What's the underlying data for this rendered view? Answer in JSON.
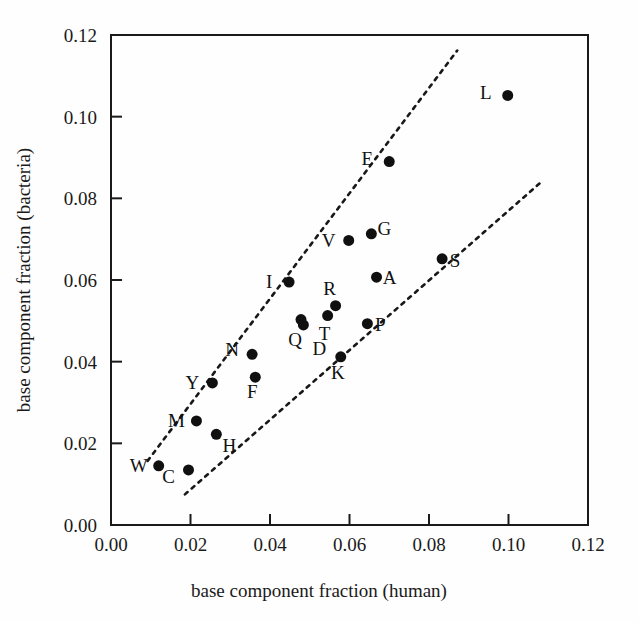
{
  "chart_data": {
    "type": "scatter",
    "title": "",
    "xlabel": "base component fraction (human)",
    "ylabel": "base component fraction (bacteria)",
    "xlim": [
      0.0,
      0.12
    ],
    "ylim": [
      0.0,
      0.12
    ],
    "xticks": [
      "0.00",
      "0.02",
      "0.04",
      "0.06",
      "0.08",
      "0.10",
      "0.12"
    ],
    "yticks": [
      "0.00",
      "0.02",
      "0.04",
      "0.06",
      "0.08",
      "0.10",
      "0.12"
    ],
    "xtick_values": [
      0.0,
      0.02,
      0.04,
      0.06,
      0.08,
      0.1,
      0.12
    ],
    "ytick_values": [
      0.0,
      0.02,
      0.04,
      0.06,
      0.08,
      0.1,
      0.12
    ],
    "grid": false,
    "legend": "none",
    "points": [
      {
        "label": "W",
        "x": 0.012,
        "y": 0.0145,
        "label_dx": -20,
        "label_dy": 6
      },
      {
        "label": "C",
        "x": 0.0195,
        "y": 0.0135,
        "label_dx": -20,
        "label_dy": 13
      },
      {
        "label": "M",
        "x": 0.0215,
        "y": 0.0255,
        "label_dx": -20,
        "label_dy": 6
      },
      {
        "label": "H",
        "x": 0.0265,
        "y": 0.0222,
        "label_dx": 13,
        "label_dy": 18
      },
      {
        "label": "Y",
        "x": 0.0255,
        "y": 0.0348,
        "label_dx": -20,
        "label_dy": 6
      },
      {
        "label": "F",
        "x": 0.0363,
        "y": 0.0362,
        "label_dx": -3,
        "label_dy": 21
      },
      {
        "label": "N",
        "x": 0.0355,
        "y": 0.0418,
        "label_dx": -20,
        "label_dy": 2
      },
      {
        "label": "I",
        "x": 0.0448,
        "y": 0.0595,
        "label_dx": -20,
        "label_dy": 6
      },
      {
        "label": "Q",
        "x": 0.0478,
        "y": 0.0503,
        "label_dx": -6,
        "label_dy": 26
      },
      {
        "label": "D",
        "x": 0.0484,
        "y": 0.049,
        "label_dx": 16,
        "label_dy": 30
      },
      {
        "label": "K",
        "x": 0.0578,
        "y": 0.0412,
        "label_dx": -3,
        "label_dy": 22
      },
      {
        "label": "T",
        "x": 0.0545,
        "y": 0.0513,
        "label_dx": -3,
        "label_dy": 24
      },
      {
        "label": "R",
        "x": 0.0565,
        "y": 0.0537,
        "label_dx": -6,
        "label_dy": -11
      },
      {
        "label": "P",
        "x": 0.0645,
        "y": 0.0493,
        "label_dx": 13,
        "label_dy": 7
      },
      {
        "label": "V",
        "x": 0.0598,
        "y": 0.0697,
        "label_dx": -20,
        "label_dy": 7
      },
      {
        "label": "G",
        "x": 0.0655,
        "y": 0.0713,
        "label_dx": 13,
        "label_dy": 1
      },
      {
        "label": "A",
        "x": 0.0668,
        "y": 0.0607,
        "label_dx": 13,
        "label_dy": 7
      },
      {
        "label": "E",
        "x": 0.07,
        "y": 0.089,
        "label_dx": -22,
        "label_dy": 3
      },
      {
        "label": "S",
        "x": 0.0833,
        "y": 0.0652,
        "label_dx": 13,
        "label_dy": 8
      },
      {
        "label": "L",
        "x": 0.0998,
        "y": 0.1052,
        "label_dx": -22,
        "label_dy": 4
      }
    ],
    "reference_lines": [
      {
        "name": "upper-bound-line",
        "x1": 0.0092,
        "y1": 0.0157,
        "x2": 0.0871,
        "y2": 0.1162,
        "style": "dashed"
      },
      {
        "name": "lower-bound-line",
        "x1": 0.0186,
        "y1": 0.0075,
        "x2": 0.108,
        "y2": 0.0838,
        "style": "dashed"
      }
    ],
    "marker": {
      "shape": "circle",
      "color": "#101010",
      "size_px": 11
    },
    "axes_color": "#1a1a1a"
  }
}
